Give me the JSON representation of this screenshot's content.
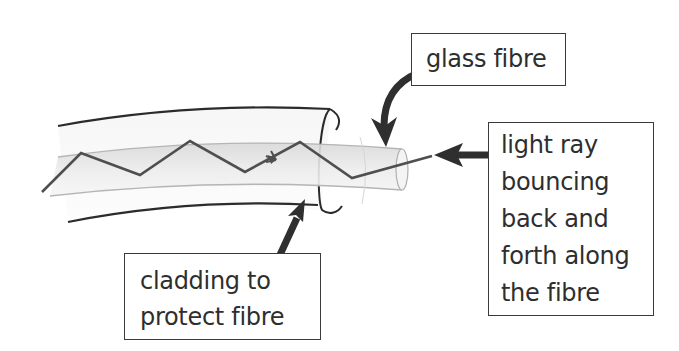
{
  "diagram": {
    "labels": {
      "glass_fibre": {
        "lines": [
          "glass fibre"
        ]
      },
      "light_ray": {
        "lines": [
          "light ray",
          "bouncing",
          "back and",
          "forth along",
          "the fibre"
        ]
      },
      "cladding": {
        "lines": [
          "cladding to",
          "protect fibre"
        ]
      }
    },
    "colors": {
      "outline": "#2b2b2b",
      "ray": "#555555",
      "fibre_fill": "#e6e6e6",
      "fibre_edge": "#bdbdbd",
      "arrow": "#2f2f2f",
      "text": "#2e2e2e"
    }
  }
}
